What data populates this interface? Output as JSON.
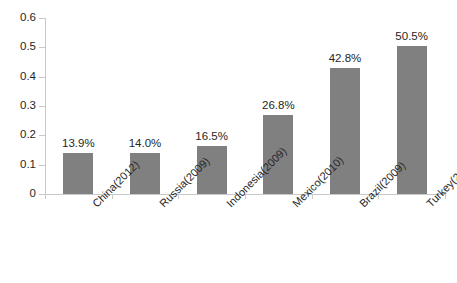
{
  "chart_data": {
    "type": "bar",
    "title": "",
    "subtitle": "",
    "xlabel": "",
    "ylabel": "",
    "categories": [
      "China(2012)",
      "Russia(2009)",
      "Indonesia(2009)",
      "Mexico(2010)",
      "Brazil(2009)",
      "Turkey(2008)"
    ],
    "values": [
      0.139,
      0.14,
      0.165,
      0.268,
      0.428,
      0.505
    ],
    "data_labels": [
      "13.9%",
      "14.0%",
      "16.5%",
      "26.8%",
      "42.8%",
      "50.5%"
    ],
    "ylim": [
      0,
      0.6
    ],
    "ytick_labels": [
      "0",
      "0.1",
      "0.2",
      "0.3",
      "0.4",
      "0.5",
      "0.6"
    ],
    "ytick_values": [
      0,
      0.1,
      0.2,
      0.3,
      0.4,
      0.5,
      0.6
    ],
    "grid": false,
    "legend": false,
    "legend_position": "none",
    "bar_color": "#808080",
    "axis_color": "#c9c9c9",
    "text_color": "#262626",
    "background_color": "#ffffff",
    "category_label_rotation_degrees": -45
  }
}
